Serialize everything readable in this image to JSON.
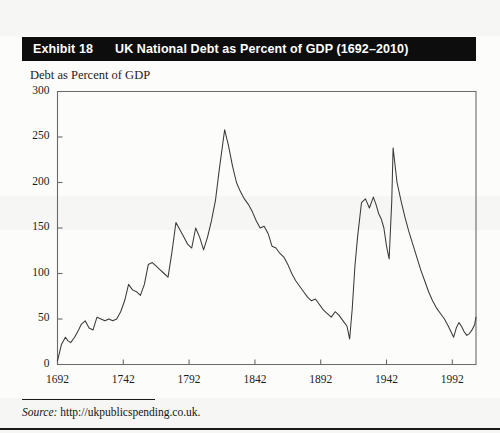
{
  "exhibit": {
    "label": "Exhibit 18",
    "title": "UK National Debt as Percent of GDP (1692–2010)",
    "banner_color": "#0d0d0d",
    "banner_text_color": "#ffffff"
  },
  "source": {
    "prefix": "Source:",
    "text": " http://ukpublicspending.co.uk."
  },
  "chart_data": {
    "type": "line",
    "title": "UK National Debt as Percent of GDP (1692–2010)",
    "subtitle": "Debt as Percent of GDP",
    "xlabel": "",
    "ylabel": "Debt as Percent of GDP",
    "xlim": [
      1692,
      2010
    ],
    "ylim": [
      0,
      300
    ],
    "yticks": [
      0,
      50,
      100,
      150,
      200,
      250,
      300
    ],
    "ytick_labels": [
      "0",
      "50",
      "100",
      "150",
      "200",
      "250",
      "300"
    ],
    "xticks": [
      1692,
      1742,
      1792,
      1842,
      1892,
      1942,
      1992
    ],
    "xtick_labels": [
      "1692",
      "1742",
      "1792",
      "1842",
      "1892",
      "1942",
      "1992"
    ],
    "grid": false,
    "legend": false,
    "line_color": "#3a3a3a",
    "series": [
      {
        "name": "UK national debt (% of GDP)",
        "x": [
          1692,
          1695,
          1698,
          1700,
          1702,
          1705,
          1708,
          1710,
          1713,
          1716,
          1719,
          1722,
          1725,
          1728,
          1731,
          1734,
          1737,
          1740,
          1743,
          1746,
          1749,
          1752,
          1755,
          1758,
          1761,
          1764,
          1767,
          1770,
          1773,
          1776,
          1779,
          1782,
          1785,
          1788,
          1791,
          1794,
          1797,
          1800,
          1803,
          1806,
          1809,
          1812,
          1815,
          1819,
          1822,
          1825,
          1828,
          1831,
          1834,
          1837,
          1840,
          1843,
          1846,
          1849,
          1852,
          1855,
          1858,
          1861,
          1864,
          1867,
          1870,
          1873,
          1876,
          1879,
          1882,
          1885,
          1888,
          1891,
          1894,
          1897,
          1900,
          1903,
          1906,
          1909,
          1912,
          1914,
          1916,
          1918,
          1920,
          1923,
          1926,
          1929,
          1932,
          1934,
          1936,
          1938,
          1940,
          1942,
          1944,
          1946,
          1947,
          1950,
          1953,
          1956,
          1959,
          1962,
          1965,
          1968,
          1971,
          1974,
          1977,
          1980,
          1983,
          1986,
          1989,
          1991,
          1993,
          1995,
          1997,
          1999,
          2001,
          2003,
          2005,
          2007,
          2009,
          2010
        ],
        "values": [
          4,
          22,
          30,
          26,
          24,
          30,
          38,
          44,
          48,
          40,
          38,
          52,
          50,
          48,
          50,
          48,
          50,
          58,
          70,
          88,
          82,
          80,
          76,
          88,
          110,
          112,
          108,
          104,
          100,
          96,
          124,
          156,
          148,
          140,
          132,
          128,
          150,
          140,
          126,
          140,
          158,
          180,
          215,
          258,
          240,
          218,
          200,
          190,
          182,
          176,
          168,
          158,
          150,
          152,
          144,
          130,
          128,
          122,
          118,
          110,
          100,
          92,
          86,
          80,
          74,
          70,
          72,
          66,
          60,
          56,
          52,
          58,
          54,
          48,
          42,
          28,
          62,
          108,
          140,
          178,
          182,
          172,
          184,
          176,
          166,
          160,
          150,
          130,
          116,
          180,
          238,
          200,
          180,
          162,
          146,
          132,
          118,
          104,
          92,
          80,
          70,
          62,
          56,
          50,
          42,
          36,
          30,
          40,
          46,
          42,
          36,
          32,
          34,
          38,
          44,
          52
        ]
      }
    ]
  },
  "axes": {
    "y_caption": "Debt as Percent of GDP"
  }
}
